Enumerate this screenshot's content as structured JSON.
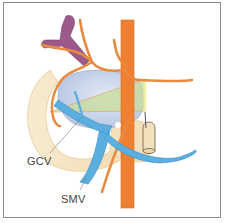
{
  "diagram": {
    "type": "anatomical-illustration",
    "labels": [
      {
        "id": "gcv",
        "text": "GCV",
        "x": 27,
        "y": 155
      },
      {
        "id": "smv",
        "text": "SMV",
        "x": 61,
        "y": 195
      }
    ],
    "colors": {
      "artery": "#e98a3f",
      "aorta": "#ef8032",
      "vein": "#5aaee0",
      "portal_vein_purple": "#9b5a8a",
      "pancreas": "#f5e6c6",
      "tumor_mass": "#c9d6ea",
      "resection_plane": "#c8dc9a",
      "frame_border": "#8a8a8a",
      "label_text": "#444444",
      "leader_line": "#777777"
    }
  }
}
